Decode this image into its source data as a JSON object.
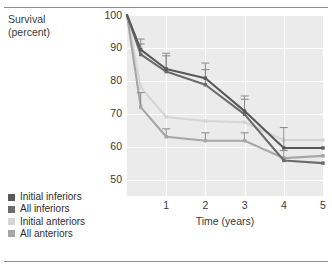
{
  "chart_data": {
    "type": "line",
    "title": "",
    "ylabel": "Survival\n(percent)",
    "xlabel": "Time (years)",
    "xlim": [
      0,
      5
    ],
    "ylim": [
      45,
      100
    ],
    "xticks": [
      "1",
      "2",
      "3",
      "4",
      "5"
    ],
    "xtick_values": [
      1,
      2,
      3,
      4,
      5
    ],
    "yticks": [
      "50",
      "60",
      "70",
      "80",
      "90",
      "100"
    ],
    "ytick_values": [
      50,
      60,
      70,
      80,
      90,
      100
    ],
    "grid": true,
    "legend_position": "outside-bottom-left",
    "series": [
      {
        "name": "Initial inferiors",
        "color": "#59595b",
        "x": [
          0,
          0.35,
          1,
          2,
          3,
          4,
          5
        ],
        "values": [
          100,
          89.5,
          83.6,
          80.8,
          70.8,
          59.6,
          59.6
        ],
        "errors": [
          null,
          3.2,
          4.8,
          4.6,
          4.6,
          6.2,
          null
        ]
      },
      {
        "name": "All inferiors",
        "color": "#6b6b6d",
        "x": [
          0,
          0.35,
          1,
          2,
          3,
          4,
          5
        ],
        "values": [
          100,
          88.0,
          82.8,
          78.8,
          69.8,
          55.8,
          55.0
        ],
        "errors": [
          null,
          3.2,
          4.8,
          4.6,
          4.6,
          3.0,
          null
        ]
      },
      {
        "name": "Initial anteriors",
        "color": "#d5d5d5",
        "x": [
          0,
          0.35,
          1,
          2,
          3,
          4,
          5
        ],
        "values": [
          100,
          78.0,
          69.0,
          67.8,
          67.4,
          62.0,
          62.0
        ],
        "errors": [
          null,
          null,
          null,
          null,
          null,
          null,
          null
        ]
      },
      {
        "name": "All anteriors",
        "color": "#a6a6a8",
        "x": [
          0,
          0.35,
          1,
          2,
          3,
          4,
          5
        ],
        "values": [
          100,
          72.0,
          63.0,
          61.8,
          61.8,
          56.5,
          57.2
        ],
        "errors": [
          null,
          4.4,
          2.4,
          2.4,
          2.4,
          null,
          null
        ]
      }
    ],
    "legend": [
      {
        "label": "Initial inferiors",
        "color": "#59595b"
      },
      {
        "label": "All inferiors",
        "color": "#6b6b6d"
      },
      {
        "label": "Initial anteriors",
        "color": "#d5d5d5"
      },
      {
        "label": "All anteriors",
        "color": "#a6a6a8"
      }
    ]
  }
}
